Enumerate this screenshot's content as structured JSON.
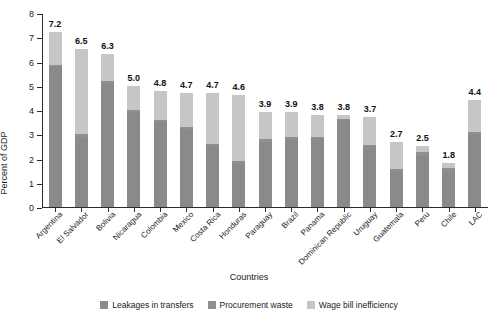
{
  "chart_data": {
    "type": "bar",
    "stacked": true,
    "title": "",
    "xlabel": "Countries",
    "ylabel": "Percent of GDP",
    "ylim": [
      0,
      8
    ],
    "yticks": [
      0,
      1,
      2,
      3,
      4,
      5,
      6,
      7,
      8
    ],
    "ytick_labels": [
      "0",
      "1",
      "2",
      "3",
      "4",
      "5",
      "6",
      "7",
      "8"
    ],
    "grid": false,
    "legend_position": "bottom-center",
    "categories": [
      "Argentina",
      "El Salvador",
      "Bolivia",
      "Nicaragua",
      "Colombia",
      "Mexico",
      "Costa Rica",
      "Honduras",
      "Paraguay",
      "Brazil",
      "Panama",
      "Dominican Republic",
      "Uruguay",
      "Guatemala",
      "Peru",
      "Chile",
      "LAC"
    ],
    "series": [
      {
        "name": "Leakages in transfers",
        "color": "#8a8a8a",
        "values": [
          5.8,
          2.9,
          5.1,
          3.9,
          3.5,
          3.2,
          2.5,
          1.8,
          2.7,
          2.8,
          2.85,
          3.6,
          2.5,
          1.5,
          2.1,
          1.5,
          3.0
        ]
      },
      {
        "name": "Procurement waste",
        "color": "#909090",
        "values": [
          0.05,
          0.1,
          0.1,
          0.1,
          0.1,
          0.1,
          0.1,
          0.1,
          0.1,
          0.1,
          0.05,
          0.05,
          0.05,
          0.05,
          0.15,
          0.1,
          0.1
        ]
      },
      {
        "name": "Wage bill inefficiency",
        "color": "#c6c6c6",
        "values": [
          1.35,
          3.5,
          1.1,
          1.0,
          1.2,
          1.4,
          2.1,
          2.7,
          1.1,
          1.0,
          0.9,
          0.15,
          1.15,
          1.15,
          0.25,
          0.2,
          1.3
        ]
      }
    ],
    "data_labels": [
      "7.2",
      "6.5",
      "6.3",
      "5.0",
      "4.8",
      "4.7",
      "4.7",
      "4.6",
      "3.9",
      "3.9",
      "3.8",
      "3.8",
      "3.7",
      "2.7",
      "2.5",
      "1.8",
      "4.4"
    ],
    "totals": [
      7.2,
      6.5,
      6.3,
      5.0,
      4.8,
      4.7,
      4.7,
      4.6,
      3.9,
      3.9,
      3.8,
      3.8,
      3.7,
      2.7,
      2.5,
      1.8,
      4.4
    ]
  }
}
